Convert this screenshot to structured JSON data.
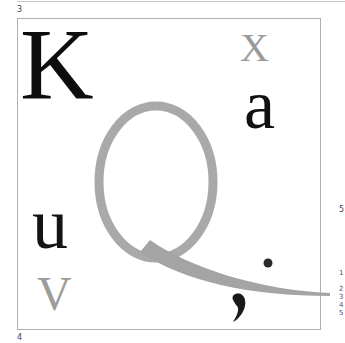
{
  "labels": {
    "top_left": "3",
    "bottom_left": "4",
    "right_mid": "5",
    "right_list": [
      "1",
      "2",
      "3",
      "4",
      "5"
    ]
  },
  "glyphs": {
    "K": {
      "char": "K",
      "color": "#0d0d0d"
    },
    "X": {
      "char": "X",
      "color": "#9a9a9a"
    },
    "a": {
      "char": "a",
      "color": "#111111"
    },
    "Q": {
      "char": "Q",
      "color": "#a8a8a8"
    },
    "u": {
      "char": "u",
      "color": "#141414"
    },
    "v": {
      "char": "V",
      "color": "#9c9c9c"
    },
    "dot": {
      "char": ".",
      "color": "#2a2a2a"
    },
    "comma": {
      "char": ",",
      "color": "#1a1a1a"
    }
  }
}
